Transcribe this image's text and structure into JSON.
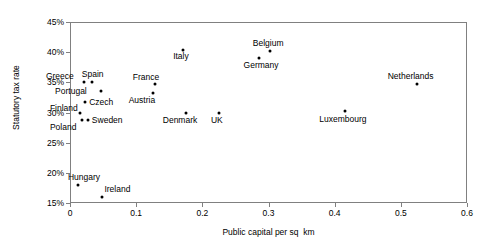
{
  "chart_data": {
    "type": "scatter",
    "title": "",
    "xlabel": "Public capital per sq  km",
    "ylabel": "Statutory tax rate",
    "xlim": [
      0,
      0.6
    ],
    "ylim": [
      0.15,
      0.45
    ],
    "grid": false,
    "legend": "none",
    "x_tick_labels": [
      "0",
      "0.1",
      "0.2",
      "0.3",
      "0.4",
      "0.5",
      "0.6"
    ],
    "x_tick_values": [
      0,
      0.1,
      0.2,
      0.3,
      0.4,
      0.5,
      0.6
    ],
    "y_tick_labels": [
      "15%",
      "20%",
      "25%",
      "30%",
      "35%",
      "40%",
      "45%"
    ],
    "y_tick_values": [
      0.15,
      0.2,
      0.25,
      0.3,
      0.35,
      0.4,
      0.45
    ],
    "points": [
      {
        "label": "Greece",
        "x": 0.021,
        "y": 0.35,
        "label_dx": -38,
        "label_dy": -10
      },
      {
        "label": "Spain",
        "x": 0.033,
        "y": 0.35,
        "label_dx": -10,
        "label_dy": -12
      },
      {
        "label": "Portugal",
        "x": 0.047,
        "y": 0.335,
        "label_dx": -46,
        "label_dy": -4
      },
      {
        "label": "Czech",
        "x": 0.023,
        "y": 0.318,
        "label_dx": 4,
        "label_dy": -4
      },
      {
        "label": "Finland",
        "x": 0.015,
        "y": 0.3,
        "label_dx": -30,
        "label_dy": -9
      },
      {
        "label": "Sweden",
        "x": 0.027,
        "y": 0.288,
        "label_dx": 4,
        "label_dy": -4
      },
      {
        "label": "Poland",
        "x": 0.018,
        "y": 0.288,
        "label_dx": -32,
        "label_dy": 3
      },
      {
        "label": "Hungary",
        "x": 0.012,
        "y": 0.18,
        "label_dx": -10,
        "label_dy": -12
      },
      {
        "label": "Ireland",
        "x": 0.049,
        "y": 0.16,
        "label_dx": 2,
        "label_dy": -12
      },
      {
        "label": "France",
        "x": 0.128,
        "y": 0.347,
        "label_dx": -22,
        "label_dy": -11
      },
      {
        "label": "Austria",
        "x": 0.125,
        "y": 0.333,
        "label_dx": -24,
        "label_dy": 3
      },
      {
        "label": "Italy",
        "x": 0.171,
        "y": 0.403,
        "label_dx": -10,
        "label_dy": 2
      },
      {
        "label": "Denmark",
        "x": 0.175,
        "y": 0.3,
        "label_dx": -23,
        "label_dy": 3
      },
      {
        "label": "UK",
        "x": 0.225,
        "y": 0.3,
        "label_dx": -8,
        "label_dy": 3
      },
      {
        "label": "Germany",
        "x": 0.285,
        "y": 0.39,
        "label_dx": -15,
        "label_dy": 3
      },
      {
        "label": "Belgium",
        "x": 0.302,
        "y": 0.402,
        "label_dx": -17,
        "label_dy": -12
      },
      {
        "label": "Luxembourg",
        "x": 0.416,
        "y": 0.303,
        "label_dx": -26,
        "label_dy": 4
      },
      {
        "label": "Netherlands",
        "x": 0.524,
        "y": 0.347,
        "label_dx": -29,
        "label_dy": -12
      }
    ]
  }
}
